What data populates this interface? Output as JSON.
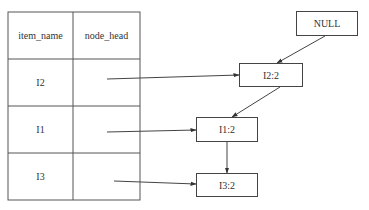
{
  "table": {
    "headers": [
      "item_name",
      "node_head"
    ],
    "rows": [
      {
        "item_name": "I2",
        "node_head": ""
      },
      {
        "item_name": "I1",
        "node_head": ""
      },
      {
        "item_name": "I3",
        "node_head": ""
      }
    ]
  },
  "nodes": {
    "null": "NULL",
    "i2": "I2:2",
    "i1": "I1:2",
    "i3": "I3:2"
  },
  "edges": [
    {
      "from": "table.I2.node_head",
      "to": "I2:2"
    },
    {
      "from": "table.I1.node_head",
      "to": "I1:2"
    },
    {
      "from": "table.I3.node_head",
      "to": "I3:2"
    },
    {
      "from": "NULL",
      "to": "I2:2"
    },
    {
      "from": "I2:2",
      "to": "I1:2"
    },
    {
      "from": "I1:2",
      "to": "I3:2"
    }
  ],
  "colors": {
    "line": "#444444",
    "text": "#333333",
    "background": "#ffffff"
  }
}
